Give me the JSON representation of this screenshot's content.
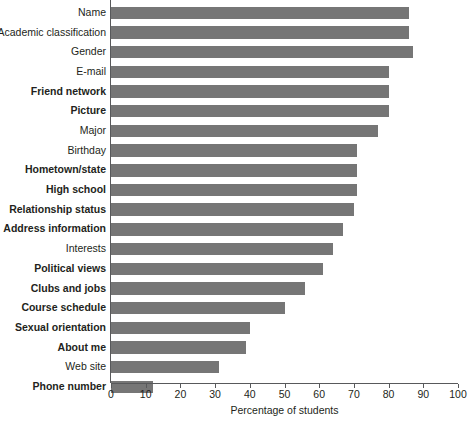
{
  "chart_data": {
    "type": "bar",
    "orientation": "horizontal",
    "title": "",
    "xlabel": "Percentage of students",
    "ylabel": "",
    "xlim": [
      0,
      100
    ],
    "xticks": [
      0,
      10,
      20,
      30,
      40,
      50,
      60,
      70,
      80,
      90,
      100
    ],
    "grid": false,
    "legend": false,
    "bar_color": "#767676",
    "axis_color": "#58595b",
    "text_color": "#231f20",
    "categories": [
      "Name",
      "Academic classification",
      "Gender",
      "E-mail",
      "Friend network",
      "Picture",
      "Major",
      "Birthday",
      "Hometown/state",
      "High school",
      "Relationship status",
      "Address information",
      "Interests",
      "Political views",
      "Clubs and jobs",
      "Course schedule",
      "Sexual orientation",
      "About me",
      "Web site",
      "Phone number"
    ],
    "values": [
      86,
      86,
      87,
      80,
      80,
      80,
      77,
      71,
      71,
      71,
      70,
      67,
      64,
      61,
      56,
      50,
      40,
      39,
      31,
      12
    ],
    "emphasis": [
      false,
      false,
      false,
      false,
      true,
      true,
      false,
      false,
      true,
      true,
      true,
      true,
      false,
      true,
      true,
      true,
      true,
      true,
      false,
      true
    ]
  }
}
